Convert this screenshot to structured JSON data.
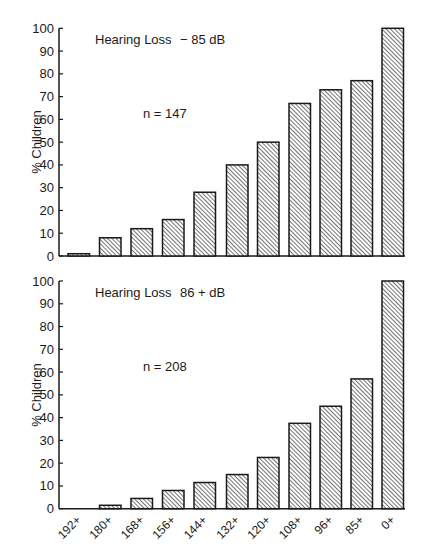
{
  "chart_data": [
    {
      "type": "bar",
      "title": "Hearing Loss    − 85 dB",
      "annotation": "n = 147",
      "xlabel": "",
      "ylabel": "% Children",
      "ylim": [
        0,
        100
      ],
      "yticks": [
        0,
        10,
        20,
        30,
        40,
        50,
        60,
        70,
        80,
        90,
        100
      ],
      "grid": false,
      "categories": [
        "192+",
        "180+",
        "168+",
        "156+",
        "144+",
        "132+",
        "120+",
        "108+",
        "96+",
        "85+",
        "0+"
      ],
      "values": [
        1,
        8,
        12,
        16,
        28,
        40,
        50,
        67,
        73,
        77,
        100
      ],
      "show_xtick_labels": false
    },
    {
      "type": "bar",
      "title": "Hearing Loss    86 + dB",
      "annotation": "n = 208",
      "xlabel": "",
      "ylabel": "% Children",
      "ylim": [
        0,
        100
      ],
      "yticks": [
        0,
        10,
        20,
        30,
        40,
        50,
        60,
        70,
        80,
        90,
        100
      ],
      "grid": false,
      "categories": [
        "192+",
        "180+",
        "168+",
        "156+",
        "144+",
        "132+",
        "120+",
        "108+",
        "96+",
        "85+",
        "0+"
      ],
      "values": [
        0,
        1.5,
        4.5,
        8,
        11.5,
        15,
        22.5,
        37.5,
        45,
        57,
        100
      ],
      "show_xtick_labels": true
    }
  ],
  "panels": [
    {
      "label_title": "Hearing Loss",
      "label_range": "− 85 dB",
      "n_label": "n = 147",
      "ylabel": "% Children"
    },
    {
      "label_title": "Hearing Loss",
      "label_range": "86 + dB",
      "n_label": "n = 208",
      "ylabel": "% Children"
    }
  ],
  "style": {
    "bar_stroke": "#1a1a1a",
    "hatch_color": "#2a2a2a",
    "background": "#ffffff"
  }
}
